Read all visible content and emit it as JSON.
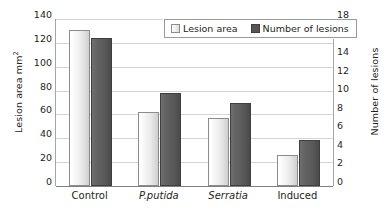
{
  "chart_data": {
    "type": "bar",
    "title": "",
    "categories": [
      "Control",
      "P.putida",
      "Serratia",
      "Induced"
    ],
    "category_styles": [
      "normal",
      "italic",
      "italic",
      "normal"
    ],
    "series": [
      {
        "name": "Lesion area",
        "axis": "left",
        "unit": "mm2",
        "values": [
          131,
          62,
          57,
          26
        ]
      },
      {
        "name": "Number of lesions",
        "axis": "right",
        "unit": "lesions",
        "values": [
          16.0,
          10.0,
          9.0,
          5.0
        ]
      }
    ],
    "xlabel": "",
    "ylabel": "Lesion area mm2",
    "ylabel_right": "Number of lesions",
    "ylim": [
      0,
      140
    ],
    "ylim_right": [
      0,
      18
    ],
    "yticks": [
      0,
      20,
      40,
      60,
      80,
      100,
      120,
      140
    ],
    "yticks_right": [
      0,
      2,
      4,
      6,
      8,
      10,
      12,
      14,
      16,
      18
    ],
    "grid": true,
    "legend_position": "top-right-inside",
    "colors": {
      "lesion_area": "#e9e9e9",
      "number_of_lesions": "#585858",
      "gridline": "#d4d4d4",
      "axis": "#7f7f7f",
      "text": "#231f20"
    }
  },
  "axes": {
    "left": {
      "title_main": "Lesion area mm",
      "title_sup": "2",
      "ticks": [
        "140",
        "120",
        "100",
        "80",
        "60",
        "40",
        "20",
        "0"
      ]
    },
    "right": {
      "title": "Number of lesions",
      "ticks": [
        "18",
        "16",
        "14",
        "12",
        "10",
        "8",
        "6",
        "4",
        "2",
        "0"
      ]
    }
  },
  "legend": {
    "entries": [
      {
        "label": "Lesion area"
      },
      {
        "label": "Number of lesions"
      }
    ]
  }
}
